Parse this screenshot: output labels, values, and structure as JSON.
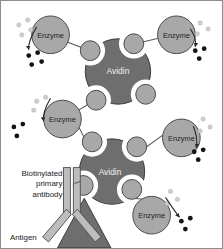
{
  "figure": {
    "background": "#ffffff",
    "border_color": "#8d8d8d"
  },
  "colors": {
    "avidin_fill": "#6e6e6e",
    "avidin_stroke": "#3b3b3b",
    "enzyme_fill": "#a8a8a8",
    "enzyme_stroke": "#4a4a4a",
    "biotin_fill": "#a8a8a8",
    "biotin_stroke": "#4a4a4a",
    "link_stroke": "#5a5a5a",
    "antibody_fill": "#bdbdbd",
    "antibody_stroke": "#4a4a4a",
    "antigen_fill": "#6e6e6e",
    "antigen_stroke": "#3b3b3b",
    "substrate_dot": "#cfcfcf",
    "product_dot": "#141414",
    "arrow_stroke": "#2b2b2b",
    "label_text": "#1a1a1a"
  },
  "labels": {
    "avidin_top": "Avidin",
    "avidin_bottom": "Avidin",
    "antigen": "Antigen",
    "antibody_line1": "Biotinylated",
    "antibody_line2": "primary",
    "antibody_line3": "antibody"
  },
  "avidin_molecules": [
    {
      "id": "avidin-top",
      "label": "Avidin",
      "cx": 118,
      "cy": 71,
      "r": 33
    },
    {
      "id": "avidin-bottom",
      "label": "Avidin",
      "cx": 112,
      "cy": 172,
      "r": 33
    }
  ],
  "enzymes": [
    {
      "id": "enzyme-top-left",
      "label": "Enzyme",
      "cx": 50,
      "cy": 34,
      "r": 19
    },
    {
      "id": "enzyme-top-right",
      "label": "Enzyme",
      "cx": 177,
      "cy": 34,
      "r": 19
    },
    {
      "id": "enzyme-mid-left",
      "label": "Enzyme",
      "cx": 62,
      "cy": 119,
      "r": 19
    },
    {
      "id": "enzyme-mid-right",
      "label": "Enzyme",
      "cx": 182,
      "cy": 138,
      "r": 19
    },
    {
      "id": "enzyme-bottom",
      "label": "Enzyme",
      "cx": 152,
      "cy": 216,
      "r": 19
    }
  ],
  "biotin_balls": [
    {
      "id": "biotin-top-left",
      "cx": 90,
      "cy": 50,
      "r": 10
    },
    {
      "id": "biotin-top-right",
      "cx": 134,
      "cy": 43,
      "r": 10
    },
    {
      "id": "biotin-bottom-left",
      "cx": 96,
      "cy": 100,
      "r": 10
    },
    {
      "id": "biotin-bottom-right",
      "cx": 146,
      "cy": 94,
      "r": 10
    },
    {
      "id": "biotin-low-top-left",
      "cx": 92,
      "cy": 142,
      "r": 10
    },
    {
      "id": "biotin-low-top-right",
      "cx": 137,
      "cy": 147,
      "r": 10
    },
    {
      "id": "biotin-low-bot-left",
      "cx": 83,
      "cy": 186,
      "r": 10
    },
    {
      "id": "biotin-low-bot-right",
      "cx": 132,
      "cy": 190,
      "r": 10
    }
  ],
  "links": [
    {
      "id": "link-enzyme-top-left",
      "x1": 66,
      "y1": 41,
      "x2": 81,
      "y2": 47
    },
    {
      "id": "link-enzyme-top-right",
      "x1": 161,
      "y1": 37,
      "x2": 144,
      "y2": 41
    },
    {
      "id": "link-enzyme-mid-left-up",
      "x1": 76,
      "y1": 112,
      "x2": 87,
      "y2": 104
    },
    {
      "id": "link-enzyme-mid-left-down",
      "x1": 77,
      "y1": 126,
      "x2": 83,
      "y2": 139
    },
    {
      "id": "link-enzyme-mid-right",
      "x1": 164,
      "y1": 134,
      "x2": 147,
      "y2": 148
    },
    {
      "id": "link-enzyme-bottom",
      "x1": 143,
      "y1": 199,
      "x2": 134,
      "y2": 199
    },
    {
      "id": "link-antibody",
      "x1": 74,
      "y1": 184,
      "x2": 74,
      "y2": 184
    }
  ],
  "substrate_clusters": [
    {
      "id": "substrate-top-left",
      "dots": [
        [
          18,
          24
        ],
        [
          27,
          19
        ],
        [
          30,
          29
        ],
        [
          21,
          34
        ]
      ]
    },
    {
      "id": "substrate-top-right",
      "dots": [
        [
          200,
          22
        ],
        [
          208,
          28
        ],
        [
          197,
          33
        ]
      ]
    },
    {
      "id": "substrate-mid-left",
      "dots": [
        [
          36,
          101
        ],
        [
          45,
          97
        ],
        [
          33,
          110
        ]
      ]
    },
    {
      "id": "substrate-mid-right",
      "dots": [
        [
          203,
          119
        ],
        [
          210,
          127
        ],
        [
          200,
          131
        ]
      ]
    },
    {
      "id": "substrate-bottom",
      "dots": [
        [
          171,
          192
        ],
        [
          178,
          200
        ],
        [
          168,
          204
        ]
      ]
    }
  ],
  "product_clusters": [
    {
      "id": "product-top-left",
      "dots": [
        [
          28,
          55
        ],
        [
          37,
          52
        ],
        [
          31,
          64
        ],
        [
          41,
          61
        ]
      ]
    },
    {
      "id": "product-top-right",
      "dots": [
        [
          196,
          50
        ],
        [
          205,
          48
        ],
        [
          200,
          58
        ]
      ]
    },
    {
      "id": "product-mid-left",
      "dots": [
        [
          13,
          127
        ],
        [
          22,
          124
        ],
        [
          16,
          136
        ]
      ]
    },
    {
      "id": "product-mid-right",
      "dots": [
        [
          195,
          152
        ],
        [
          204,
          150
        ],
        [
          199,
          160
        ]
      ]
    },
    {
      "id": "product-bottom",
      "dots": [
        [
          182,
          222
        ],
        [
          191,
          219
        ],
        [
          186,
          230
        ]
      ]
    }
  ],
  "reaction_arrows": [
    {
      "id": "arrow-top-left",
      "path": "M 36 26 C 30 36 27 44 28 50"
    },
    {
      "id": "arrow-top-right",
      "path": "M 190 28 C 196 36 197 42 196 47"
    },
    {
      "id": "arrow-mid-left",
      "path": "M 50 98 C 44 108 42 116 43 122"
    },
    {
      "id": "arrow-mid-right",
      "path": "M 194 126 C 198 136 198 144 197 149"
    },
    {
      "id": "arrow-bottom",
      "path": "M 166 198 C 172 208 176 214 180 219"
    }
  ],
  "antibody": {
    "id": "biotinylated-primary-antibody",
    "label_lines": [
      "Biotinylated",
      "primary",
      "antibody"
    ],
    "label_x": 63,
    "label_y": 173,
    "stem_top_y": 168,
    "fork_y": 216
  },
  "antigen": {
    "id": "antigen",
    "label": "Antigen",
    "label_x": 9,
    "label_y": 240,
    "apex": [
      84,
      198
    ],
    "left": [
      57,
      248
    ],
    "right": [
      111,
      248
    ]
  }
}
